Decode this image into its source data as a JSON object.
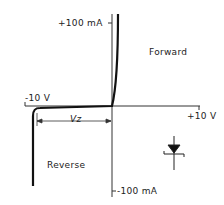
{
  "diagram": {
    "labels": {
      "y_top": "+100 mA",
      "y_bottom": "-100 mA",
      "x_left": "-10 V",
      "x_right": "+10 V",
      "forward": "Forward",
      "reverse": "Reverse",
      "vz": "Vz"
    },
    "symbol": "zener-diode",
    "colors": {
      "line": "#111111",
      "axis": "#333333",
      "background": "#ffffff"
    }
  }
}
